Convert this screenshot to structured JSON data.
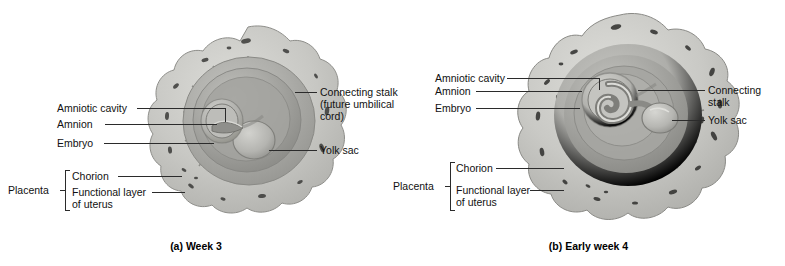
{
  "figure": {
    "type": "anatomical-diagram",
    "style": "grayscale textbook illustration",
    "colors": {
      "background": "#ffffff",
      "villi_band": "#c6c6c2",
      "chorion_ring": "#b0b0ac",
      "inner_cavity": "#a0a09c",
      "shadow": "#8a8a86",
      "highlight": "#d8d8d4",
      "leader_line": "#2b2b2b",
      "text": "#111111"
    }
  },
  "panel_a": {
    "caption": "(a) Week 3",
    "labels_left": [
      {
        "text": "Amniotic cavity",
        "name": "amniotic-cavity"
      },
      {
        "text": "Amnion",
        "name": "amnion"
      },
      {
        "text": "Embryo",
        "name": "embryo"
      }
    ],
    "labels_right": [
      {
        "text": "Connecting stalk",
        "line2": "(future umbilical",
        "line3": "cord)",
        "name": "connecting-stalk"
      },
      {
        "text": "Yolk sac",
        "name": "yolk-sac"
      }
    ],
    "bracket": {
      "group_label": "Placenta",
      "items": [
        {
          "text": "Chorion",
          "name": "chorion"
        },
        {
          "text": "Functional layer",
          "line2": "of uterus",
          "name": "functional-layer-of-uterus"
        }
      ]
    }
  },
  "panel_b": {
    "caption": "(b) Early week 4",
    "labels_left": [
      {
        "text": "Amniotic cavity",
        "name": "amniotic-cavity"
      },
      {
        "text": "Amnion",
        "name": "amnion"
      },
      {
        "text": "Embryo",
        "name": "embryo"
      }
    ],
    "labels_right": [
      {
        "text": "Connecting",
        "line2": "stalk",
        "name": "connecting-stalk"
      },
      {
        "text": "Yolk sac",
        "name": "yolk-sac"
      }
    ],
    "bracket": {
      "group_label": "Placenta",
      "items": [
        {
          "text": "Chorion",
          "name": "chorion"
        },
        {
          "text": "Functional layer",
          "line2": "of uterus",
          "name": "functional-layer-of-uterus"
        }
      ]
    }
  }
}
